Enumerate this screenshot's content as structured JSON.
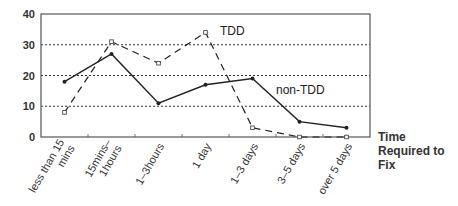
{
  "chart_data": {
    "type": "line",
    "title": "",
    "xlabel": "Time Required to Fix",
    "xlabel_lines": [
      "Time",
      "Required to",
      "Fix"
    ],
    "ylabel": "",
    "ylim": [
      0,
      40
    ],
    "yticks": [
      0,
      10,
      20,
      30,
      40
    ],
    "grid": "horizontal-dotted",
    "categories": [
      [
        "less than 15",
        "mins"
      ],
      [
        "15mins–",
        "1hours"
      ],
      [
        "1–3hours"
      ],
      [
        "1 day"
      ],
      [
        "1–3 days"
      ],
      [
        "3–5 days"
      ],
      [
        "over 5 days"
      ]
    ],
    "series": [
      {
        "name": "TDD",
        "style": "dashed",
        "marker": "open-square",
        "values": [
          8,
          31,
          24,
          34,
          3,
          0,
          0
        ]
      },
      {
        "name": "non-TDD",
        "style": "solid",
        "marker": "filled-dot",
        "values": [
          18,
          27,
          11,
          17,
          19,
          5,
          3
        ]
      }
    ],
    "legend": "inline-labels"
  }
}
